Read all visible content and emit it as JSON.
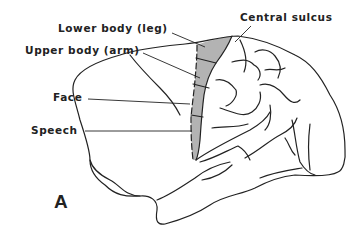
{
  "diagram": {
    "panel_letter": "A",
    "labels": {
      "lower_body": "Lower body (leg)",
      "upper_body": "Upper body (arm)",
      "face": "Face",
      "speech": "Speech",
      "central_sulcus": "Central sulcus"
    },
    "colors": {
      "outline": "#222222",
      "motor_strip": "#b3b3b3",
      "background": "#ffffff"
    }
  }
}
